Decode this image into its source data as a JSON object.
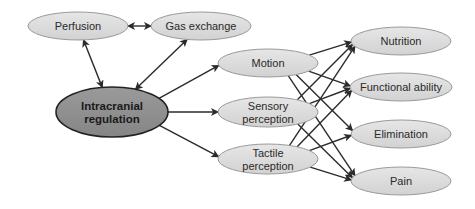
{
  "colors": {
    "node_fill": "#dcdcdc",
    "node_stroke": "#9a9a9a",
    "central_fill": "#8e8e8e",
    "central_stroke": "#222222",
    "arrow": "#2b2b2b"
  },
  "nodes": {
    "perfusion": {
      "label": "Perfusion",
      "cx": 78,
      "cy": 26,
      "rx": 50,
      "ry": 14
    },
    "gas_exchange": {
      "label": "Gas exchange",
      "cx": 201,
      "cy": 26,
      "rx": 50,
      "ry": 14
    },
    "intracranial_regulation": {
      "label_line1": "Intracranial",
      "label_line2": "regulation",
      "cx": 112,
      "cy": 112,
      "rx": 56,
      "ry": 25
    },
    "motion": {
      "label": "Motion",
      "cx": 268,
      "cy": 63,
      "rx": 50,
      "ry": 14
    },
    "sensory_perception": {
      "label_line1": "Sensory",
      "label_line2": "perception",
      "cx": 268,
      "cy": 112,
      "rx": 50,
      "ry": 15
    },
    "tactile_perception": {
      "label_line1": "Tactile",
      "label_line2": "perception",
      "cx": 268,
      "cy": 159,
      "rx": 50,
      "ry": 15
    },
    "nutrition": {
      "label": "Nutrition",
      "cx": 401,
      "cy": 41,
      "rx": 50,
      "ry": 14
    },
    "functional_ability": {
      "label": "Functional ability",
      "cx": 401,
      "cy": 87,
      "rx": 51,
      "ry": 14
    },
    "elimination": {
      "label": "Elimination",
      "cx": 401,
      "cy": 134,
      "rx": 50,
      "ry": 14
    },
    "pain": {
      "label": "Pain",
      "cx": 401,
      "cy": 181,
      "rx": 50,
      "ry": 14
    }
  },
  "edges": [
    {
      "from": "perfusion",
      "to": "gas_exchange",
      "bidirectional": true
    },
    {
      "from": "perfusion",
      "to": "intracranial_regulation",
      "bidirectional": true
    },
    {
      "from": "gas_exchange",
      "to": "intracranial_regulation",
      "bidirectional": true
    },
    {
      "from": "intracranial_regulation",
      "to": "motion",
      "bidirectional": false
    },
    {
      "from": "intracranial_regulation",
      "to": "sensory_perception",
      "bidirectional": false
    },
    {
      "from": "intracranial_regulation",
      "to": "tactile_perception",
      "bidirectional": false
    },
    {
      "from": "motion",
      "to": "nutrition",
      "bidirectional": false
    },
    {
      "from": "motion",
      "to": "functional_ability",
      "bidirectional": false
    },
    {
      "from": "motion",
      "to": "elimination",
      "bidirectional": false
    },
    {
      "from": "motion",
      "to": "pain",
      "bidirectional": false
    },
    {
      "from": "sensory_perception",
      "to": "nutrition",
      "bidirectional": false
    },
    {
      "from": "sensory_perception",
      "to": "functional_ability",
      "bidirectional": false
    },
    {
      "from": "sensory_perception",
      "to": "pain",
      "bidirectional": false
    },
    {
      "from": "tactile_perception",
      "to": "nutrition",
      "bidirectional": false
    },
    {
      "from": "tactile_perception",
      "to": "functional_ability",
      "bidirectional": false
    },
    {
      "from": "tactile_perception",
      "to": "elimination",
      "bidirectional": false
    },
    {
      "from": "tactile_perception",
      "to": "pain",
      "bidirectional": false
    }
  ]
}
